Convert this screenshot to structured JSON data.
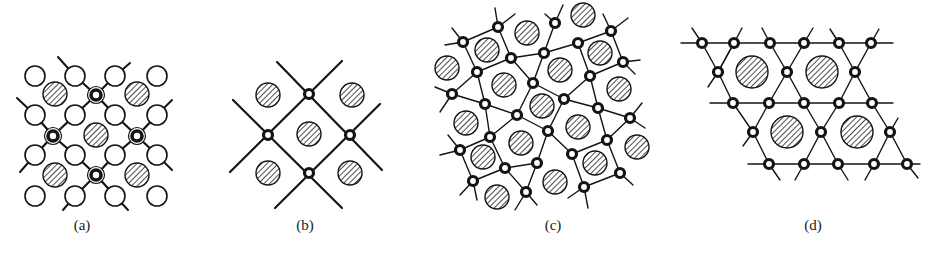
{
  "figure": {
    "colors": {
      "ink": "#141414",
      "background": "#ffffff"
    }
  },
  "legend": {
    "hatched_circle": "large hatched atom/site",
    "open_circle": "open (white) circle atom",
    "ring_atom": "small ring atom (bonded vertex)",
    "double_ring_atom": "bold double-ring atom"
  },
  "panels": [
    {
      "id": "a",
      "label": "(a)",
      "label_pos": [
        82,
        220
      ],
      "open_circles": [
        [
          35,
          76
        ],
        [
          75,
          76
        ],
        [
          115,
          76
        ],
        [
          157,
          76
        ],
        [
          35,
          115
        ],
        [
          75,
          115
        ],
        [
          115,
          115
        ],
        [
          157,
          115
        ],
        [
          35,
          155
        ],
        [
          75,
          155
        ],
        [
          115,
          155
        ],
        [
          157,
          155
        ],
        [
          35,
          196
        ],
        [
          75,
          196
        ],
        [
          115,
          196
        ],
        [
          157,
          196
        ]
      ],
      "open_r": 10,
      "hatched": [
        [
          55,
          94
        ],
        [
          137,
          94
        ],
        [
          96,
          135
        ],
        [
          55,
          175
        ],
        [
          137,
          175
        ]
      ],
      "hatched_r": 12,
      "double_rings": [
        [
          96,
          95
        ],
        [
          53,
          136
        ],
        [
          137,
          136
        ],
        [
          96,
          175
        ]
      ],
      "bonds": [
        [
          96,
          95,
          75,
          76
        ],
        [
          96,
          95,
          115,
          76
        ],
        [
          96,
          95,
          75,
          115
        ],
        [
          96,
          95,
          115,
          115
        ],
        [
          53,
          136,
          35,
          115
        ],
        [
          53,
          136,
          75,
          115
        ],
        [
          53,
          136,
          35,
          155
        ],
        [
          53,
          136,
          75,
          155
        ],
        [
          137,
          136,
          115,
          115
        ],
        [
          137,
          136,
          157,
          115
        ],
        [
          137,
          136,
          115,
          155
        ],
        [
          137,
          136,
          157,
          155
        ],
        [
          96,
          175,
          75,
          155
        ],
        [
          96,
          175,
          115,
          155
        ],
        [
          96,
          175,
          75,
          196
        ],
        [
          96,
          175,
          115,
          196
        ]
      ],
      "stubs": [
        [
          75,
          76,
          58,
          57
        ],
        [
          115,
          76,
          130,
          63
        ],
        [
          35,
          115,
          17,
          98
        ],
        [
          157,
          115,
          172,
          100
        ],
        [
          35,
          155,
          20,
          172
        ],
        [
          157,
          155,
          172,
          170
        ],
        [
          75,
          196,
          63,
          210
        ],
        [
          115,
          196,
          128,
          210
        ]
      ]
    },
    {
      "id": "b",
      "label": "(b)",
      "label_pos": [
        305,
        220
      ],
      "atoms": [
        [
          309,
          94
        ],
        [
          268,
          135
        ],
        [
          350,
          135
        ],
        [
          309,
          173
        ]
      ],
      "atom_r": 4.5,
      "hatched": [
        [
          268,
          95
        ],
        [
          352,
          95
        ],
        [
          309,
          134
        ],
        [
          268,
          173
        ],
        [
          350,
          173
        ]
      ],
      "hatched_r": 12,
      "lines": [
        [
          277,
          62,
          382,
          170
        ],
        [
          342,
          61,
          230,
          172
        ],
        [
          233,
          100,
          342,
          208
        ],
        [
          380,
          104,
          275,
          208
        ]
      ]
    },
    {
      "id": "c",
      "label": "(c)",
      "label_pos": [
        553,
        220
      ],
      "atoms": [
        [
          498,
          27
        ],
        [
          463,
          42
        ],
        [
          555,
          23
        ],
        [
          611,
          31
        ],
        [
          578,
          43
        ],
        [
          511,
          58
        ],
        [
          544,
          53
        ],
        [
          477,
          72
        ],
        [
          623,
          62
        ],
        [
          590,
          76
        ],
        [
          452,
          94
        ],
        [
          533,
          83
        ],
        [
          564,
          99
        ],
        [
          485,
          104
        ],
        [
          517,
          115
        ],
        [
          598,
          108
        ],
        [
          630,
          118
        ],
        [
          490,
          137
        ],
        [
          548,
          131
        ],
        [
          460,
          150
        ],
        [
          607,
          140
        ],
        [
          572,
          154
        ],
        [
          537,
          163
        ],
        [
          505,
          168
        ],
        [
          620,
          173
        ],
        [
          473,
          181
        ],
        [
          584,
          187
        ],
        [
          526,
          192
        ]
      ],
      "atom_r": 4.5,
      "hatched": [
        [
          583,
          15
        ],
        [
          527,
          33
        ],
        [
          487,
          50
        ],
        [
          600,
          53
        ],
        [
          447,
          68
        ],
        [
          560,
          70
        ],
        [
          504,
          85
        ],
        [
          619,
          89
        ],
        [
          542,
          106
        ],
        [
          466,
          123
        ],
        [
          578,
          127
        ],
        [
          521,
          143
        ],
        [
          637,
          147
        ],
        [
          483,
          157
        ],
        [
          595,
          163
        ],
        [
          555,
          182
        ],
        [
          497,
          197
        ]
      ],
      "hatched_r": 12,
      "bonds": [
        [
          463,
          42,
          498,
          27
        ],
        [
          463,
          42,
          477,
          72
        ],
        [
          498,
          27,
          511,
          58
        ],
        [
          477,
          72,
          511,
          58
        ],
        [
          511,
          58,
          544,
          53
        ],
        [
          544,
          53,
          555,
          23
        ],
        [
          544,
          53,
          578,
          43
        ],
        [
          578,
          43,
          611,
          31
        ],
        [
          578,
          43,
          590,
          76
        ],
        [
          611,
          31,
          623,
          62
        ],
        [
          623,
          62,
          590,
          76
        ],
        [
          544,
          53,
          533,
          83
        ],
        [
          533,
          83,
          511,
          58
        ],
        [
          477,
          72,
          452,
          94
        ],
        [
          477,
          72,
          485,
          104
        ],
        [
          452,
          94,
          485,
          104
        ],
        [
          533,
          83,
          564,
          99
        ],
        [
          533,
          83,
          517,
          115
        ],
        [
          564,
          99,
          590,
          76
        ],
        [
          564,
          99,
          598,
          108
        ],
        [
          590,
          76,
          598,
          108
        ],
        [
          485,
          104,
          517,
          115
        ],
        [
          485,
          104,
          490,
          137
        ],
        [
          517,
          115,
          548,
          131
        ],
        [
          517,
          115,
          490,
          137
        ],
        [
          564,
          99,
          548,
          131
        ],
        [
          598,
          108,
          630,
          118
        ],
        [
          598,
          108,
          607,
          140
        ],
        [
          630,
          118,
          607,
          140
        ],
        [
          490,
          137,
          460,
          150
        ],
        [
          490,
          137,
          505,
          168
        ],
        [
          460,
          150,
          473,
          181
        ],
        [
          473,
          181,
          505,
          168
        ],
        [
          548,
          131,
          537,
          163
        ],
        [
          548,
          131,
          572,
          154
        ],
        [
          537,
          163,
          505,
          168
        ],
        [
          537,
          163,
          526,
          192
        ],
        [
          572,
          154,
          607,
          140
        ],
        [
          572,
          154,
          584,
          187
        ],
        [
          607,
          140,
          620,
          173
        ],
        [
          620,
          173,
          584,
          187
        ],
        [
          526,
          192,
          505,
          168
        ]
      ],
      "stubs": [
        [
          498,
          27,
          495,
          8
        ],
        [
          498,
          27,
          515,
          14
        ],
        [
          463,
          42,
          445,
          45
        ],
        [
          463,
          42,
          452,
          28
        ],
        [
          555,
          23,
          545,
          14
        ],
        [
          555,
          23,
          563,
          5
        ],
        [
          611,
          31,
          603,
          14
        ],
        [
          611,
          31,
          628,
          18
        ],
        [
          623,
          62,
          640,
          60
        ],
        [
          623,
          62,
          635,
          74
        ],
        [
          452,
          94,
          435,
          87
        ],
        [
          452,
          94,
          440,
          112
        ],
        [
          630,
          118,
          642,
          103
        ],
        [
          630,
          118,
          645,
          128
        ],
        [
          460,
          150,
          440,
          155
        ],
        [
          460,
          150,
          448,
          135
        ],
        [
          620,
          173,
          633,
          185
        ],
        [
          473,
          181,
          460,
          195
        ],
        [
          473,
          181,
          477,
          200
        ],
        [
          526,
          192,
          515,
          210
        ],
        [
          526,
          192,
          537,
          205
        ],
        [
          584,
          187,
          568,
          198
        ],
        [
          584,
          187,
          588,
          208
        ]
      ]
    },
    {
      "id": "d",
      "label": "(d)",
      "label_pos": [
        813,
        220
      ],
      "atoms": [
        [
          702,
          43
        ],
        [
          734,
          43
        ],
        [
          770,
          43
        ],
        [
          804,
          43
        ],
        [
          839,
          43
        ],
        [
          871,
          43
        ],
        [
          718,
          72
        ],
        [
          787,
          72
        ],
        [
          855,
          72
        ],
        [
          733,
          103
        ],
        [
          769,
          103
        ],
        [
          804,
          103
        ],
        [
          839,
          103
        ],
        [
          872,
          103
        ],
        [
          753,
          132
        ],
        [
          821,
          132
        ],
        [
          890,
          132
        ],
        [
          769,
          164
        ],
        [
          804,
          164
        ],
        [
          838,
          164
        ],
        [
          874,
          164
        ],
        [
          907,
          164
        ]
      ],
      "atom_r": 4.5,
      "hatched": [
        [
          752,
          72
        ],
        [
          822,
          72
        ],
        [
          787,
          132
        ],
        [
          857,
          132
        ]
      ],
      "hatched_r": 16,
      "hlines": [
        [
          681,
          43,
          893
        ],
        [
          710,
          103,
          893
        ],
        [
          748,
          164,
          920
        ]
      ],
      "bonds": [
        [
          702,
          43,
          718,
          72
        ],
        [
          734,
          43,
          718,
          72
        ],
        [
          718,
          72,
          733,
          103
        ],
        [
          770,
          43,
          787,
          72
        ],
        [
          804,
          43,
          787,
          72
        ],
        [
          787,
          72,
          769,
          103
        ],
        [
          787,
          72,
          804,
          103
        ],
        [
          839,
          43,
          855,
          72
        ],
        [
          871,
          43,
          855,
          72
        ],
        [
          855,
          72,
          839,
          103
        ],
        [
          855,
          72,
          872,
          103
        ],
        [
          733,
          103,
          753,
          132
        ],
        [
          769,
          103,
          753,
          132
        ],
        [
          753,
          132,
          769,
          164
        ],
        [
          804,
          103,
          821,
          132
        ],
        [
          839,
          103,
          821,
          132
        ],
        [
          821,
          132,
          804,
          164
        ],
        [
          821,
          132,
          838,
          164
        ],
        [
          872,
          103,
          890,
          132
        ],
        [
          890,
          132,
          874,
          164
        ],
        [
          890,
          132,
          907,
          164
        ],
        [
          734,
          43,
          718,
          72
        ]
      ],
      "stubs": [
        [
          702,
          43,
          692,
          28
        ],
        [
          734,
          43,
          742,
          28
        ],
        [
          770,
          43,
          762,
          28
        ],
        [
          804,
          43,
          813,
          28
        ],
        [
          839,
          43,
          830,
          29
        ],
        [
          871,
          43,
          879,
          29
        ],
        [
          718,
          72,
          708,
          87
        ],
        [
          753,
          132,
          743,
          146
        ],
        [
          890,
          132,
          898,
          118
        ],
        [
          769,
          164,
          780,
          180
        ],
        [
          804,
          164,
          795,
          180
        ],
        [
          838,
          164,
          848,
          180
        ],
        [
          874,
          164,
          865,
          180
        ],
        [
          907,
          164,
          918,
          178
        ]
      ]
    }
  ]
}
